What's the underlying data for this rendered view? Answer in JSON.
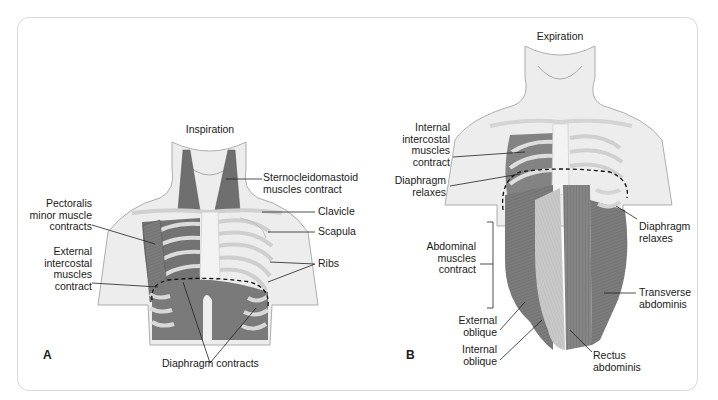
{
  "figure": {
    "panels": [
      {
        "letter": "A",
        "title": "Inspiration",
        "labels": {
          "sternocleidomastoid": "Sternocleidomastoid\nmuscles contract",
          "clavicle": "Clavicle",
          "scapula": "Scapula",
          "ribs": "Ribs",
          "pectoralis": "Pectoralis\nminor muscle\ncontracts",
          "external_intercostal": "External\nintercostal\nmuscles\ncontract",
          "diaphragm": "Diaphragm contracts"
        }
      },
      {
        "letter": "B",
        "title": "Expiration",
        "labels": {
          "internal_intercostal": "Internal\nintercostal\nmuscles\ncontract",
          "diaphragm_left": "Diaphragm\nrelaxes",
          "diaphragm_right": "Diaphragm\nrelaxes",
          "abdominal": "Abdominal\nmuscles\ncontract",
          "external_oblique": "External\noblique",
          "internal_oblique": "Internal\noblique",
          "transverse": "Transverse\nabdominis",
          "rectus": "Rectus\nabdominis"
        }
      }
    ],
    "colors": {
      "muscle": "#7a7a7a",
      "muscle_dark": "#5e5e5e",
      "skin": "#ececec",
      "bone": "#d9d9d9",
      "outline": "#8a8a8a",
      "border": "#d8d8d8"
    }
  }
}
